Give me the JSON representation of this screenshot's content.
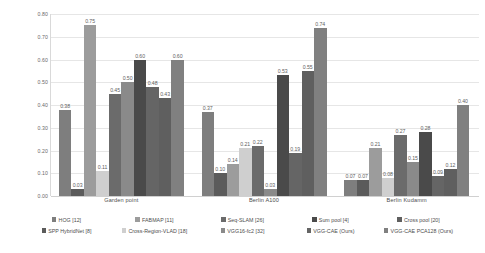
{
  "chart_data": {
    "type": "bar",
    "title": "",
    "xlabel": "",
    "ylabel": "",
    "ylim": [
      0,
      0.8
    ],
    "grid": true,
    "legend_position": "bottom",
    "categories": [
      "Garden point",
      "Berlin A100",
      "Berlin Kudamm"
    ],
    "y_ticks": [
      "0.00",
      "0.10",
      "0.20",
      "0.30",
      "0.40",
      "0.50",
      "0.60",
      "0.70",
      "0.80"
    ],
    "y_tick_values": [
      0.0,
      0.1,
      0.2,
      0.3,
      0.4,
      0.5,
      0.6,
      0.7,
      0.8
    ],
    "series": [
      {
        "name": "HOG [12]",
        "color": "#7e7e7e",
        "values": [
          0.38,
          0.37,
          0.07
        ],
        "labels": [
          "0.38",
          "0.37",
          "0.07"
        ]
      },
      {
        "name": "SPP HybridNet [8]",
        "color": "#5b5b5b",
        "values": [
          0.03,
          0.1,
          0.07
        ],
        "labels": [
          "0.03",
          "0.10",
          "0.07"
        ]
      },
      {
        "name": "FABMAP [11]",
        "color": "#9c9c9c",
        "values": [
          0.75,
          0.14,
          0.21
        ],
        "labels": [
          "0.75",
          "0.14",
          "0.21"
        ]
      },
      {
        "name": "Cross-Region-VLAD [18]",
        "color": "#cfcfcf",
        "values": [
          0.11,
          0.21,
          0.08
        ],
        "labels": [
          "0.11",
          "0.21",
          "0.08"
        ]
      },
      {
        "name": "Seq-SLAM [26]",
        "color": "#6b6b6b",
        "values": [
          0.45,
          0.22,
          0.27
        ],
        "labels": [
          "0.45",
          "0.22",
          "0.27"
        ]
      },
      {
        "name": "VGG16-fc2 [32]",
        "color": "#8a8a8a",
        "values": [
          0.5,
          0.03,
          0.15
        ],
        "labels": [
          "0.50",
          "0.03",
          "0.15"
        ]
      },
      {
        "name": "Sum pool [4]",
        "color": "#4a4a4a",
        "values": [
          0.6,
          0.53,
          0.28
        ],
        "labels": [
          "0.60",
          "0.53",
          "0.28"
        ]
      },
      {
        "name": "VGG-CAE (Ours)",
        "color": "#656565",
        "values": [
          0.48,
          0.19,
          0.09
        ],
        "labels": [
          "0.48",
          "0.19",
          "0.09"
        ]
      },
      {
        "name": "Cross pool [20]",
        "color": "#5f5f5f",
        "values": [
          0.43,
          0.55,
          0.12
        ],
        "labels": [
          "0.43",
          "0.55",
          "0.12"
        ]
      },
      {
        "name": "VGG-CAE PCA128 (Ours)",
        "color": "#808080",
        "values": [
          0.6,
          0.74,
          0.4
        ],
        "labels": [
          "0.60",
          "0.74",
          "0.40"
        ]
      }
    ],
    "legend_rows": [
      [
        "HOG [12]",
        "FABMAP [11]",
        "Seq-SLAM [26]",
        "Sum pool [4]",
        "Cross pool [20]"
      ],
      [
        "SPP HybridNet [8]",
        "Cross-Region-VLAD [18]",
        "VGG16-fc2 [32]",
        "VGG-CAE (Ours)",
        "VGG-CAE PCA128 (Ours)"
      ]
    ]
  }
}
